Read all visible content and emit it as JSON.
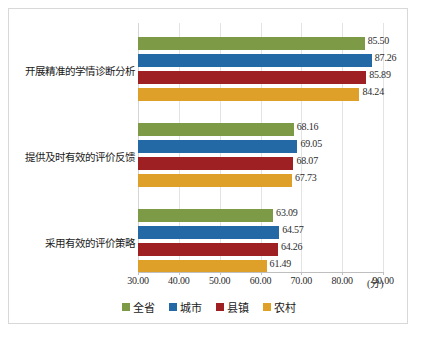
{
  "chart_data": {
    "type": "bar",
    "orientation": "horizontal",
    "title": "",
    "xlabel": "(分)",
    "ylabel": "",
    "xlim": [
      30.0,
      90.0
    ],
    "xticks": [
      "30.00",
      "40.00",
      "50.00",
      "60.00",
      "70.00",
      "80.00",
      "90.00"
    ],
    "xtick_values": [
      30,
      40,
      50,
      60,
      70,
      80,
      90
    ],
    "grid": true,
    "legend_position": "bottom-center",
    "categories": [
      "开展精准的学情诊断分析",
      "提供及时有效的评价反馈",
      "采用有效的评价策略"
    ],
    "series": [
      {
        "name": "全省",
        "color": "#7d9a47",
        "values": [
          85.5,
          68.16,
          63.09
        ]
      },
      {
        "name": "城市",
        "color": "#2269a6",
        "values": [
          87.26,
          69.05,
          64.57
        ]
      },
      {
        "name": "县镇",
        "color": "#9e2022",
        "values": [
          85.89,
          68.07,
          64.26
        ]
      },
      {
        "name": "农村",
        "color": "#dfa02a",
        "values": [
          84.24,
          67.73,
          61.49
        ]
      }
    ],
    "value_labels": [
      [
        "85.50",
        "87.26",
        "85.89",
        "84.24"
      ],
      [
        "68.16",
        "69.05",
        "68.07",
        "67.73"
      ],
      [
        "63.09",
        "64.57",
        "64.26",
        "61.49"
      ]
    ]
  },
  "legend": {
    "items": [
      {
        "label": "全省",
        "color": "#7d9a47"
      },
      {
        "label": "城市",
        "color": "#2269a6"
      },
      {
        "label": "县镇",
        "color": "#9e2022"
      },
      {
        "label": "农村",
        "color": "#dfa02a"
      }
    ]
  },
  "axis": {
    "unit_label": "(分)"
  }
}
